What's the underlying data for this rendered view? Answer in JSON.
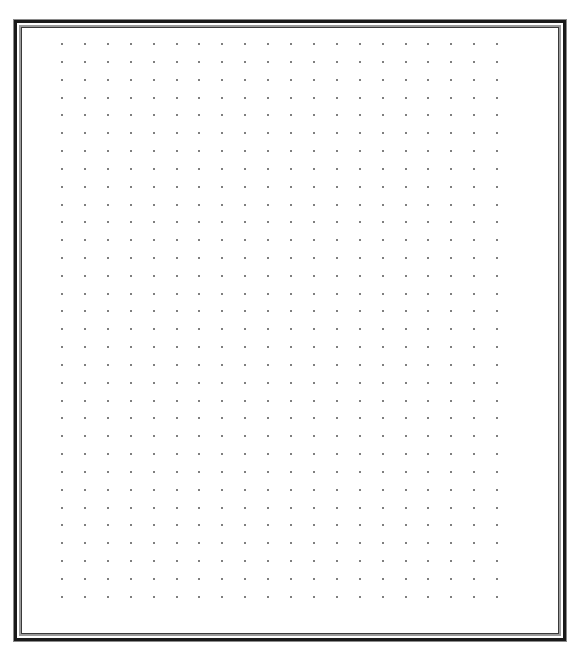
{
  "page": {
    "type": "dot-grid-paper",
    "background_color": "#ffffff"
  },
  "frame": {
    "style": "double-line-border",
    "outer_line_color": "#8a8a8a",
    "thick_line_color": "#1a1a1a",
    "inner_gray_color": "#9a9a9a",
    "inner_line_color": "#3a3a3a"
  },
  "grid": {
    "columns": 20,
    "rows": 32,
    "origin_x": 62,
    "origin_y": 44,
    "spacing_x": 22.9,
    "spacing_y": 17.83,
    "dot_size": 2,
    "dot_color": "#555555"
  }
}
